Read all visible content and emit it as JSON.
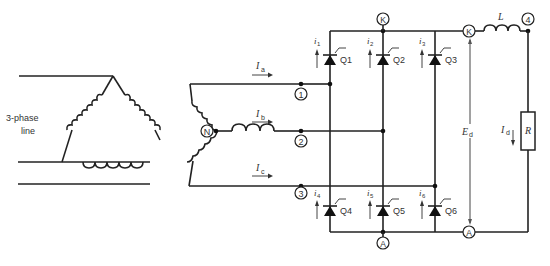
{
  "diagram": {
    "source_label": [
      "3-phase",
      "line"
    ],
    "neutral_node": "N",
    "phase_currents": [
      {
        "symbol": "I",
        "sub": "a"
      },
      {
        "symbol": "I",
        "sub": "b"
      },
      {
        "symbol": "I",
        "sub": "c"
      }
    ],
    "terminals": [
      "1",
      "2",
      "3",
      "4"
    ],
    "bus_nodes": {
      "cathode": "K",
      "anode": "A"
    },
    "thyristors": [
      {
        "name": "Q1",
        "current": "i",
        "current_sub": "1"
      },
      {
        "name": "Q2",
        "current": "i",
        "current_sub": "2"
      },
      {
        "name": "Q3",
        "current": "i",
        "current_sub": "3"
      },
      {
        "name": "Q4",
        "current": "i",
        "current_sub": "4"
      },
      {
        "name": "Q5",
        "current": "i",
        "current_sub": "5"
      },
      {
        "name": "Q6",
        "current": "i",
        "current_sub": "6"
      }
    ],
    "load": {
      "inductor": "L",
      "resistor": "R",
      "voltage": {
        "symbol": "E",
        "sub": "d"
      },
      "current": {
        "symbol": "I",
        "sub": "d"
      }
    }
  }
}
